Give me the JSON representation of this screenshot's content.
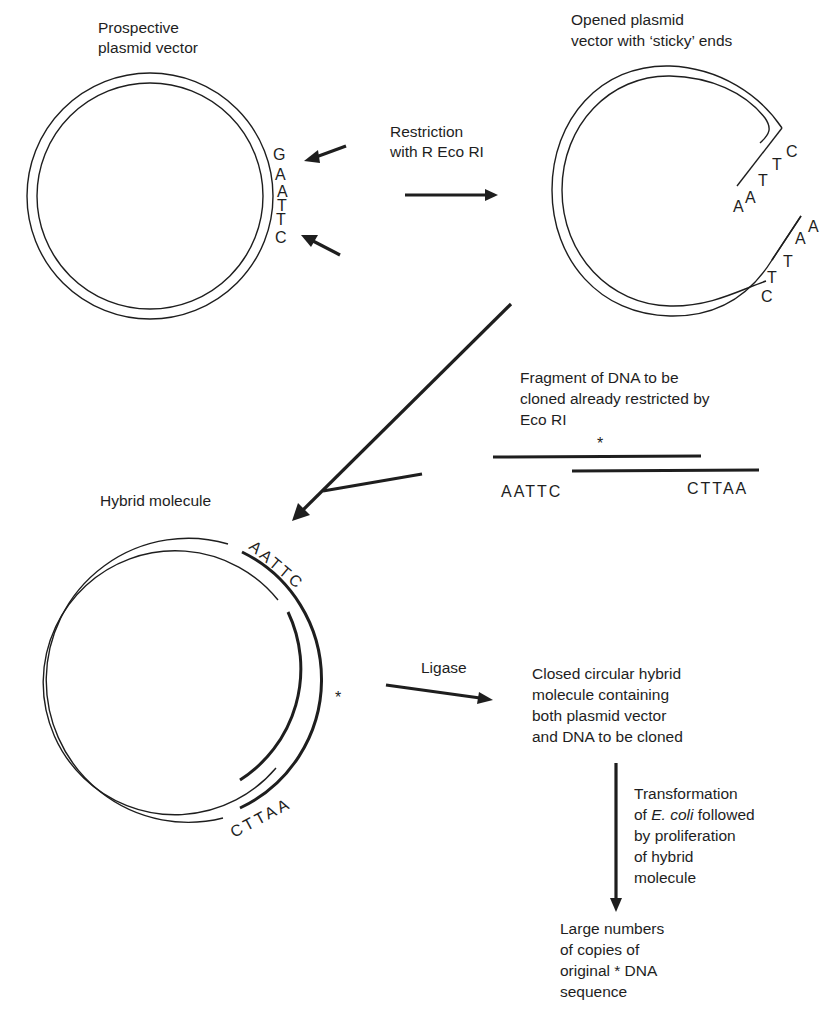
{
  "colors": {
    "ink": "#1e1e1e",
    "background": "#ffffff"
  },
  "plasmid": {
    "label_line1": "Prospective",
    "label_line2": "plasmid vector",
    "site_bases": [
      "G",
      "A",
      "A",
      "T",
      "T",
      "C"
    ]
  },
  "restriction": {
    "label_line1": "Restriction",
    "label_line2": "with R Eco RI"
  },
  "opened": {
    "label_line1": "Opened plasmid",
    "label_line2": "vector with ‘sticky’ ends",
    "upper_end_bases": [
      "A",
      "A",
      "T",
      "T",
      "C"
    ],
    "lower_end_bases": [
      "C",
      "T",
      "T",
      "A",
      "A"
    ]
  },
  "fragment": {
    "label_line1": "Fragment of DNA to be",
    "label_line2": "cloned already restricted by",
    "label_line3": "Eco RI",
    "marker": "*",
    "left_end": "AATTC",
    "right_end": "CTTAA"
  },
  "hybrid": {
    "label": "Hybrid molecule",
    "top_bases": "AATTC",
    "bottom_bases": "CTTAA",
    "marker": "*"
  },
  "ligase": {
    "label": "Ligase"
  },
  "closed": {
    "line1": "Closed circular hybrid",
    "line2": "molecule containing",
    "line3": "both plasmid vector",
    "line4": "and DNA to be cloned"
  },
  "transformation": {
    "line1": "Transformation",
    "line2_prefix": "of ",
    "line2_italic": "E. coli",
    "line2_suffix": " followed",
    "line3": "by proliferation",
    "line4": "of hybrid",
    "line5": "molecule"
  },
  "result": {
    "line1": "Large numbers",
    "line2": "of copies of",
    "line3": "original * DNA",
    "line4": "sequence"
  }
}
